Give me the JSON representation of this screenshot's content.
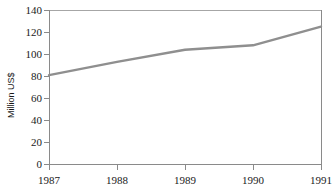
{
  "chart_data": {
    "type": "line",
    "title": "",
    "xlabel": "",
    "ylabel": "Million US$",
    "categories": [
      "1987",
      "1988",
      "1989",
      "1990",
      "1991"
    ],
    "x": [
      1987,
      1988,
      1989,
      1990,
      1991
    ],
    "values": [
      81,
      93,
      104,
      108,
      125
    ],
    "series": [
      {
        "name": "Million US$",
        "values": [
          81,
          93,
          104,
          108,
          125
        ]
      }
    ],
    "xlim": [
      1987,
      1991
    ],
    "ylim": [
      0,
      140
    ],
    "yticks": [
      0,
      20,
      40,
      60,
      80,
      100,
      120,
      140
    ],
    "ytick_labels": [
      "0",
      "20",
      "40",
      "60",
      "80",
      "100",
      "120",
      "140"
    ],
    "xticks": [
      1987,
      1988,
      1989,
      1990,
      1991
    ],
    "xtick_labels": [
      "1987",
      "1988",
      "1989",
      "1990",
      "1991"
    ],
    "grid": false,
    "legend": "none",
    "line_color": "#8f8f8f",
    "axis_color": "#808080",
    "frame_color": "#a0a0a0",
    "background": "#ffffff"
  },
  "axis": {
    "y_title": "Million US$"
  }
}
